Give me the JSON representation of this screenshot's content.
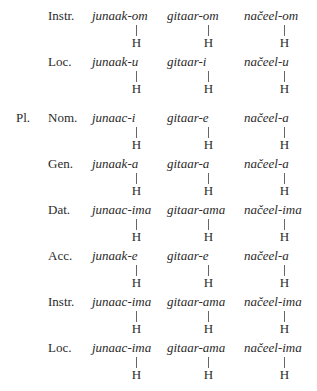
{
  "table": {
    "rows": [
      {
        "number": "",
        "case": "Instr.",
        "forms": [
          "junaak-om",
          "gitaar-om",
          "načeel-om"
        ],
        "tone": [
          "H",
          "H",
          "H"
        ]
      },
      {
        "number": "",
        "case": "Loc.",
        "forms": [
          "junaak-u",
          "gitaar-i",
          "načeel-u"
        ],
        "tone": [
          "H",
          "H",
          "H"
        ]
      },
      {
        "number": "Pl.",
        "case": "Nom.",
        "forms": [
          "junaac-i",
          "gitaar-e",
          "načeel-a"
        ],
        "tone": [
          "H",
          "H",
          "H"
        ]
      },
      {
        "number": "",
        "case": "Gen.",
        "forms": [
          "junaak-a",
          "gitaar-a",
          "načeel-a"
        ],
        "tone": [
          "H",
          "H",
          "H"
        ]
      },
      {
        "number": "",
        "case": "Dat.",
        "forms": [
          "junaac-ima",
          "gitaar-ama",
          "načeel-ima"
        ],
        "tone": [
          "H",
          "H",
          "H"
        ]
      },
      {
        "number": "",
        "case": "Acc.",
        "forms": [
          "junaak-e",
          "gitaar-e",
          "načeel-a"
        ],
        "tone": [
          "H",
          "H",
          "H"
        ]
      },
      {
        "number": "",
        "case": "Instr.",
        "forms": [
          "junaac-ima",
          "gitaar-ama",
          "načeel-ima"
        ],
        "tone": [
          "H",
          "H",
          "H"
        ]
      },
      {
        "number": "",
        "case": "Loc.",
        "forms": [
          "junaac-ima",
          "gitaar-ama",
          "načeel-ima"
        ],
        "tone": [
          "H",
          "H",
          "H"
        ]
      }
    ]
  }
}
